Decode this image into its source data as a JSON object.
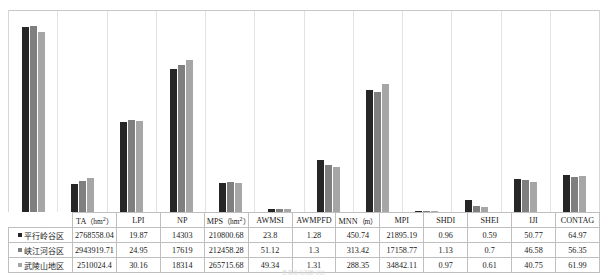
{
  "caption": "景观格局指数对比",
  "colors": {
    "series0": "#262626",
    "series1": "#7f7f7f",
    "series2": "#a6a6a6",
    "grid": "#e3e3e3",
    "border": "#bfbfbf"
  },
  "chart_data": {
    "type": "bar",
    "title": "",
    "xlabel": "",
    "ylabel": "",
    "grid": true,
    "legend_position": "row-labels",
    "categories": [
      "TA (hm²)",
      "LPI",
      "NP",
      "MPS (hm²)",
      "AWMSI",
      "AWMPFD",
      "MNN (m)",
      "MPI",
      "SHDI",
      "SHEI",
      "IJI",
      "CONTAG"
    ],
    "series": [
      {
        "name": "平行岭谷区",
        "values": [
          2768558.04,
          19.87,
          14303,
          210800.68,
          23.8,
          1.28,
          450.74,
          21895.19,
          0.96,
          0.59,
          50.77,
          64.97
        ],
        "bar_heights_px": [
          185,
          28,
          90,
          143,
          29,
          3,
          52,
          122,
          1,
          12,
          33,
          37
        ]
      },
      {
        "name": "峡江河谷区",
        "values": [
          2943919.71,
          24.95,
          17619,
          212458.28,
          51.12,
          1.3,
          313.42,
          17158.77,
          1.13,
          0.7,
          46.58,
          56.35
        ],
        "bar_heights_px": [
          186,
          31,
          92,
          147,
          30,
          3,
          47,
          120,
          1,
          6,
          32,
          35
        ]
      },
      {
        "name": "武陵山地区",
        "values": [
          2510024.4,
          30.16,
          18314,
          265715.68,
          49.34,
          1.31,
          288.35,
          34842.11,
          0.97,
          0.61,
          40.75,
          61.99
        ],
        "bar_heights_px": [
          180,
          34,
          91,
          152,
          29,
          3,
          45,
          128,
          1,
          5,
          30,
          36
        ]
      }
    ]
  },
  "table": {
    "header_first_cell": "",
    "columns": [
      "TA (hm²)",
      "LPI",
      "NP",
      "MPS (hm²)",
      "AWMSI",
      "AWMPFD",
      "MNN (m)",
      "MPI",
      "SHDI",
      "SHEI",
      "IJI",
      "CONTAG"
    ],
    "rows": [
      {
        "label": "平行岭谷区",
        "swatch": "series0",
        "cells": [
          "2768558.04",
          "19.87",
          "14303",
          "210800.68",
          "23.8",
          "1.28",
          "450.74",
          "21895.19",
          "0.96",
          "0.59",
          "50.77",
          "64.97"
        ]
      },
      {
        "label": "峡江河谷区",
        "swatch": "series1",
        "cells": [
          "2943919.71",
          "24.95",
          "17619",
          "212458.28",
          "51.12",
          "1.3",
          "313.42",
          "17158.77",
          "1.13",
          "0.7",
          "46.58",
          "56.35"
        ]
      },
      {
        "label": "武陵山地区",
        "swatch": "series2",
        "cells": [
          "2510024.4",
          "30.16",
          "18314",
          "265715.68",
          "49.34",
          "1.31",
          "288.35",
          "34842.11",
          "0.97",
          "0.61",
          "40.75",
          "61.99"
        ]
      }
    ]
  }
}
